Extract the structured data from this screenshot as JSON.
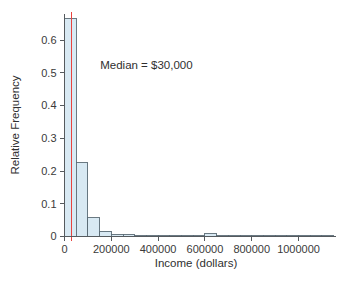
{
  "chart_data": {
    "type": "bar",
    "title": "",
    "xlabel": "Income (dollars)",
    "ylabel": "Relative Frequency",
    "xlim": [
      0,
      1160000
    ],
    "ylim": [
      0,
      0.68
    ],
    "grid": false,
    "legend": null,
    "bin_width": 50000,
    "bin_edges": [
      0,
      50000,
      100000,
      150000,
      200000,
      250000,
      300000,
      350000,
      400000,
      450000,
      500000,
      550000,
      600000,
      650000,
      700000,
      750000,
      800000,
      850000,
      900000,
      950000,
      1000000,
      1050000,
      1100000,
      1150000
    ],
    "categories": [
      "0-50000",
      "50000-100000",
      "100000-150000",
      "150000-200000",
      "200000-250000",
      "250000-300000",
      "300000-350000",
      "350000-400000",
      "400000-450000",
      "450000-500000",
      "500000-550000",
      "550000-600000",
      "600000-650000",
      "650000-700000",
      "700000-750000",
      "750000-800000",
      "800000-850000",
      "850000-900000",
      "900000-950000",
      "950000-1000000",
      "1000000-1050000",
      "1050000-1100000",
      "1100000-1150000"
    ],
    "values": [
      0.665,
      0.225,
      0.058,
      0.016,
      0.006,
      0.005,
      0.002,
      0.001,
      0.001,
      0.001,
      0.001,
      0.001,
      0.009,
      0.003,
      0.001,
      0.0,
      0.0,
      0.0,
      0.0,
      0.0,
      0.0,
      0.0,
      0.0
    ],
    "xticks": [
      0,
      200000,
      400000,
      600000,
      800000,
      1000000
    ],
    "xtick_labels": [
      "0",
      "200000",
      "400000",
      "600000",
      "800000",
      "1000000"
    ],
    "yticks": [
      0,
      0.1,
      0.2,
      0.3,
      0.4,
      0.5,
      0.6
    ],
    "ytick_labels": [
      "0",
      "0.1",
      "0.2",
      "0.3",
      "0.4",
      "0.5",
      "0.6"
    ],
    "annotations": [
      {
        "name": "median-label",
        "text": "Median = $30,000",
        "x": 350000,
        "y": 0.525
      }
    ],
    "markers": [
      {
        "name": "median-line",
        "type": "vline",
        "value": 30000,
        "color": "#e8433f"
      }
    ],
    "colors": {
      "bar_fill": "#d8e9f3",
      "bar_stroke": "#5a6a74",
      "axis": "#555a5e",
      "text": "#2f2f2f",
      "median": "#e8433f",
      "background": "#ffffff"
    }
  }
}
